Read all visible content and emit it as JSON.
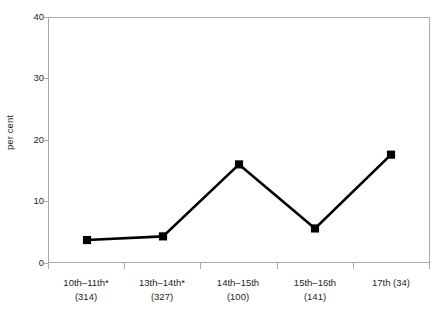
{
  "chart_data": {
    "type": "line",
    "title": "",
    "xlabel": "",
    "ylabel": "per cent",
    "ylim": [
      0,
      40
    ],
    "yticks": [
      0,
      10,
      20,
      30,
      40
    ],
    "grid": false,
    "legend": null,
    "categories": [
      "10th–11th*",
      "13th–14th*",
      "14th–15th",
      "15th–16th",
      "17th (34)"
    ],
    "category_counts": [
      "(314)",
      "(327)",
      "(100)",
      "(141)",
      ""
    ],
    "category_labels_line1": [
      "10th–11th*",
      "13th–14th*",
      "14th–15th",
      "15th–16th",
      "17th (34)"
    ],
    "category_labels_line2": [
      "(314)",
      "(327)",
      "(100)",
      "(141)",
      ""
    ],
    "series": [
      {
        "name": "per cent",
        "values": [
          3.6,
          4.2,
          16.0,
          5.5,
          17.6
        ],
        "color": "#000000",
        "marker": "square"
      }
    ],
    "footnote_marker": "*"
  },
  "axis": {
    "y_tick_labels": [
      "40",
      "30",
      "20",
      "10",
      "0"
    ],
    "y_axis_title": "per cent"
  },
  "style": {
    "line_color": "#000000",
    "marker_color": "#000000",
    "axis_color": "#a7a9ac",
    "text_color": "#231f20",
    "background": "#ffffff"
  }
}
